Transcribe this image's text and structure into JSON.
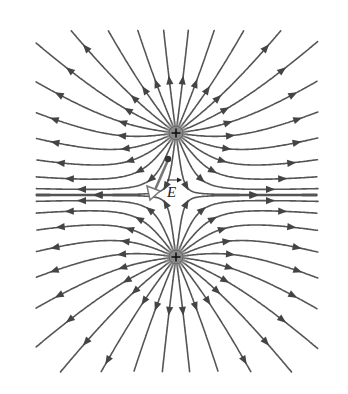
{
  "diagram": {
    "charges": [
      {
        "id": "upper",
        "sign": "+",
        "charge": 1
      },
      {
        "id": "lower",
        "sign": "+",
        "charge": 1
      }
    ],
    "field_lines_per_charge": 24,
    "field_direction": "outward",
    "field_vector": {
      "symbol": "E",
      "has_vector_arrow": true,
      "description": "Electric field vector at a point between the charges, pointing away from the upper charge"
    },
    "colors": {
      "line": "#555555",
      "arrow": "#444444",
      "charge": "#8a8a8a",
      "vector": "#777777",
      "background": "#ffffff"
    }
  }
}
